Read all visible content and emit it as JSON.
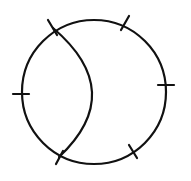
{
  "canvas": {
    "width": 191,
    "height": 181,
    "background": "#ffffff"
  },
  "style": {
    "stroke_color": "#111111",
    "stroke_width": 2.2
  },
  "outer_circle": {
    "cx": 94,
    "cy": 92,
    "r": 72
  },
  "inner_arc": {
    "start": [
      53,
      28
    ],
    "control": [
      128,
      92
    ],
    "end": [
      59,
      157
    ]
  },
  "ticks": [
    {
      "name": "tick-top-left-intersection",
      "x1": 48,
      "y1": 20,
      "x2": 57,
      "y2": 35
    },
    {
      "name": "tick-top-right",
      "x1": 129,
      "y1": 16,
      "x2": 121,
      "y2": 30
    },
    {
      "name": "tick-right",
      "x1": 158,
      "y1": 85,
      "x2": 174,
      "y2": 85
    },
    {
      "name": "tick-bottom-right",
      "x1": 129,
      "y1": 145,
      "x2": 137,
      "y2": 158
    },
    {
      "name": "tick-bottom-left-intersection",
      "x1": 63,
      "y1": 151,
      "x2": 56,
      "y2": 164
    },
    {
      "name": "tick-left",
      "x1": 13,
      "y1": 94,
      "x2": 29,
      "y2": 94
    }
  ]
}
